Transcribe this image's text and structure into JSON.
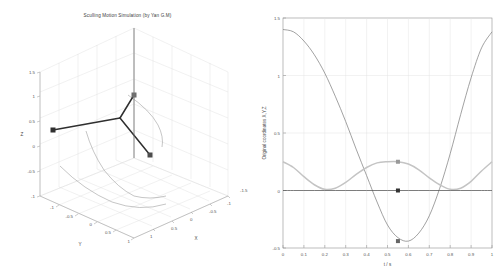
{
  "figure": {
    "background": "#ffffff",
    "width": 501,
    "height": 277
  },
  "left_panel": {
    "title": "Sculling Motion Simulation (by Yan G.M)",
    "axis_labels": {
      "x": "X",
      "y": "Y",
      "z": "Z"
    },
    "x_ticks": [
      "-1.5",
      "-1",
      "-0.5",
      "0",
      "0.5",
      "1"
    ],
    "y_ticks": [
      "-1",
      "-0.5",
      "0",
      "0.5",
      "1"
    ],
    "z_ticks": [
      "-1",
      "-0.5",
      "0",
      "0.5",
      "1",
      "1.5"
    ],
    "series_color": "#333333",
    "trace_color": "#888888",
    "grid_color": "#d8d8d8"
  },
  "chart_data": [
    {
      "type": "line",
      "name": "sculling-3d-trajectory",
      "projection": "3d",
      "title": "Sculling Motion Simulation (by Yan G.M)",
      "xlabel": "X",
      "ylabel": "Y",
      "zlabel": "Z",
      "xlim": [
        -1.5,
        1.5
      ],
      "ylim": [
        -1.5,
        1.5
      ],
      "zlim": [
        -1,
        1.5
      ],
      "grid": true,
      "series": [
        {
          "name": "body-frame-axes",
          "style": "thick-line-with-square-markers",
          "color": "#333333",
          "points": [
            [
              -1.05,
              -0.3,
              0.1
            ],
            [
              -0.1,
              0.35,
              0.45
            ],
            [
              0.3,
              1.05,
              1.0
            ],
            [
              -0.1,
              0.35,
              0.45
            ],
            [
              0.55,
              -0.35,
              -0.3
            ]
          ],
          "markers": [
            [
              -1.05,
              -0.3,
              0.1
            ],
            [
              0.3,
              1.05,
              1.0
            ],
            [
              0.55,
              -0.35,
              -0.3
            ]
          ]
        },
        {
          "name": "trace-axis-1",
          "style": "thin-line",
          "color": "#8a8a8a",
          "description": "swept arc from upper tip curving right and down"
        },
        {
          "name": "trace-axis-2",
          "style": "thin-line",
          "color": "#8a8a8a",
          "description": "swept arc sweeping from left marker down and across base plane"
        },
        {
          "name": "trace-axis-3",
          "style": "thin-line",
          "color": "#8a8a8a",
          "description": "swept arc from lower-right marker across base plane"
        }
      ]
    },
    {
      "type": "line",
      "name": "original-coordinates-vs-time",
      "title": "",
      "xlabel": "t / s",
      "ylabel": "Original coordinates X,Y,Z",
      "xlim": [
        0,
        1
      ],
      "ylim": [
        -0.5,
        1.5
      ],
      "grid": true,
      "legend": "none",
      "x_ticks": [
        "0",
        "0.1",
        "0.2",
        "0.3",
        "0.4",
        "0.5",
        "0.6",
        "0.7",
        "0.8",
        "0.9",
        "1"
      ],
      "y_ticks": [
        "-0.5",
        "0",
        "0.5",
        "1",
        "1.5"
      ],
      "x": [
        0,
        0.05,
        0.1,
        0.15,
        0.2,
        0.25,
        0.3,
        0.35,
        0.4,
        0.45,
        0.5,
        0.55,
        0.6,
        0.65,
        0.7,
        0.75,
        0.8,
        0.85,
        0.9,
        0.95,
        1
      ],
      "series": [
        {
          "name": "X",
          "color": "#7a7a7a",
          "values": [
            1.4,
            1.38,
            1.3,
            1.18,
            1.02,
            0.82,
            0.6,
            0.36,
            0.13,
            -0.1,
            -0.3,
            -0.41,
            -0.44,
            -0.37,
            -0.22,
            0.02,
            0.32,
            0.66,
            0.98,
            1.24,
            1.38
          ]
        },
        {
          "name": "Y",
          "color": "#c4c4c4",
          "values": [
            0.25,
            0.2,
            0.12,
            0.05,
            0.01,
            0.02,
            0.07,
            0.14,
            0.2,
            0.24,
            0.25,
            0.25,
            0.23,
            0.18,
            0.11,
            0.05,
            0.01,
            0.02,
            0.08,
            0.17,
            0.25
          ]
        },
        {
          "name": "Z",
          "color": "#4a4a4a",
          "values": [
            0,
            0,
            0,
            0,
            0,
            0,
            0,
            0,
            0,
            0,
            0,
            0,
            0,
            0,
            0,
            0,
            0,
            0,
            0,
            0,
            0
          ]
        }
      ],
      "markers": [
        {
          "series": "Y",
          "x": 0.55,
          "y": 0.25,
          "color": "#999999"
        },
        {
          "series": "Z",
          "x": 0.55,
          "y": 0.0,
          "color": "#333333"
        },
        {
          "series": "X",
          "x": 0.55,
          "y": -0.44,
          "color": "#666666"
        }
      ]
    }
  ]
}
